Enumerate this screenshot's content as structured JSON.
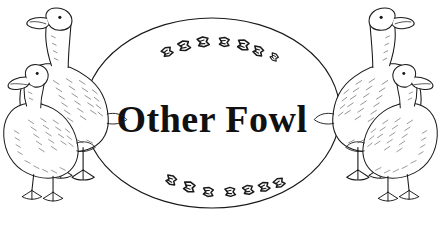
{
  "artwork": {
    "kind": "line-art-illustration",
    "title_text": "Other Fowl",
    "background_color": "#ffffff",
    "ink_color": "#1a1a1a",
    "width": 441,
    "height": 237
  },
  "frame": {
    "name": "oval-frame",
    "shape": "ellipse",
    "center_x": 212,
    "center_y": 113,
    "radius_x": 128,
    "radius_y": 95,
    "stroke_color": "#1a1a1a",
    "fill_color": "#ffffff"
  },
  "title": {
    "text": "Other Fowl",
    "x": 212,
    "y": 132,
    "font_size_px": 38,
    "color": "#111111"
  },
  "tracks": {
    "top_label": "webbed-footprint-trail-top",
    "bottom_label": "webbed-footprint-trail-bottom",
    "top_count": 7,
    "bottom_count": 7,
    "top_prints": [
      {
        "x": 167,
        "y": 52,
        "size": 9,
        "rot": -28
      },
      {
        "x": 184,
        "y": 46,
        "size": 10,
        "rot": -18
      },
      {
        "x": 203,
        "y": 42,
        "size": 10,
        "rot": -10
      },
      {
        "x": 224,
        "y": 42,
        "size": 9,
        "rot": 4
      },
      {
        "x": 243,
        "y": 45,
        "size": 10,
        "rot": 12
      },
      {
        "x": 258,
        "y": 51,
        "size": 9,
        "rot": 22
      },
      {
        "x": 274,
        "y": 57,
        "size": 7,
        "rot": 32
      }
    ],
    "bottom_prints": [
      {
        "x": 171,
        "y": 180,
        "size": 9,
        "rot": 22
      },
      {
        "x": 189,
        "y": 187,
        "size": 10,
        "rot": 14
      },
      {
        "x": 208,
        "y": 192,
        "size": 9,
        "rot": 6
      },
      {
        "x": 230,
        "y": 192,
        "size": 9,
        "rot": -6
      },
      {
        "x": 248,
        "y": 190,
        "size": 9,
        "rot": -14
      },
      {
        "x": 264,
        "y": 187,
        "size": 9,
        "rot": -20
      },
      {
        "x": 279,
        "y": 183,
        "size": 9,
        "rot": -28
      }
    ]
  },
  "birds": {
    "left_group_label": "left-fowl-pair",
    "right_group_label": "right-fowl-pair",
    "left_back_label": "goose-tall-left",
    "left_front_label": "duck-short-left",
    "right_back_label": "goose-tall-right",
    "right_front_label": "duck-short-right",
    "count": 4,
    "species_depicted": "ducks and geese"
  }
}
